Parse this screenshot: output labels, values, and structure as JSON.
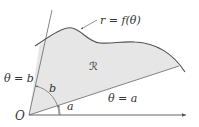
{
  "diagram": {
    "labels": {
      "curve": "r = f(θ)",
      "ray_b": "θ = b",
      "ray_a": "θ = a",
      "region": "ℛ",
      "angle_b": "b",
      "angle_a": "a",
      "origin": "O"
    },
    "colors": {
      "region_fill": "#e6e6e6",
      "curve_stroke": "#555555",
      "line_stroke": "#666666",
      "text": "#333333"
    }
  }
}
